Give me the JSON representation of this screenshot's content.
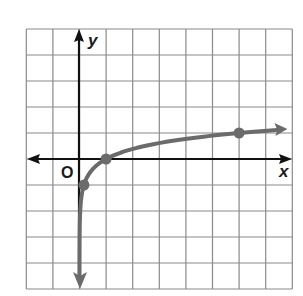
{
  "graph": {
    "x_label": "x",
    "y_label": "y",
    "origin_label": "O",
    "grid": {
      "x_min": -2,
      "x_max": 8,
      "y_min": -5,
      "y_max": 5,
      "step": 1
    },
    "colors": {
      "grid": "#8a8a8a",
      "axis": "#111111",
      "curve": "#6b6b6b"
    },
    "function": "y = log6(x)",
    "points": [
      {
        "x": 0.1667,
        "y": -1
      },
      {
        "x": 1,
        "y": 0
      },
      {
        "x": 6,
        "y": 1
      }
    ]
  },
  "chart_data": {
    "type": "line",
    "title": "",
    "xlabel": "x",
    "ylabel": "y",
    "xlim": [
      -2,
      8
    ],
    "ylim": [
      -5,
      5
    ],
    "grid": true,
    "series": [
      {
        "name": "y = log6(x)",
        "x": [
          0.0026,
          0.028,
          0.1667,
          0.5,
          1,
          2,
          3,
          4,
          5,
          6,
          7,
          8
        ],
        "y": [
          -3.3,
          -2,
          -1,
          -0.39,
          0,
          0.39,
          0.61,
          0.77,
          0.9,
          1,
          1.09,
          1.16
        ]
      }
    ],
    "marked_points": [
      [
        0.1667,
        -1
      ],
      [
        1,
        0
      ],
      [
        6,
        1
      ]
    ]
  }
}
